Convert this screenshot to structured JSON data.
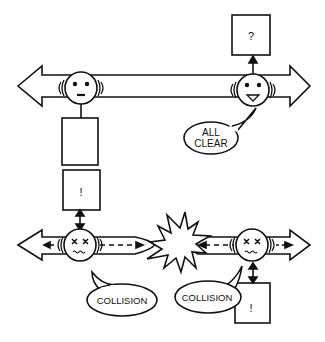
{
  "diagram": {
    "top_scenario": {
      "left_agent": {
        "expression": "neutral",
        "attached_box_label": ""
      },
      "right_agent": {
        "expression": "happy",
        "box_label": "?",
        "speech": [
          "ALL",
          "CLEAR"
        ]
      }
    },
    "bottom_scenario": {
      "left_agent": {
        "expression": "dazed",
        "box_label": "!",
        "speech": "COLLISION"
      },
      "right_agent": {
        "expression": "dazed",
        "box_label": "!",
        "speech": "COLLISION"
      },
      "impact_icon": "explosion"
    }
  },
  "colors": {
    "stroke": "#111111",
    "fill": "#ffffff"
  }
}
